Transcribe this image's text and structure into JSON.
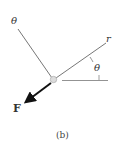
{
  "diagram": {
    "labels": {
      "theta_axis": "θ",
      "r_axis": "r",
      "angle": "θ",
      "force": "F",
      "caption": "(b)"
    },
    "colors": {
      "line": "#555555",
      "arrow": "#111111",
      "particle": "#d8d8d8"
    }
  }
}
